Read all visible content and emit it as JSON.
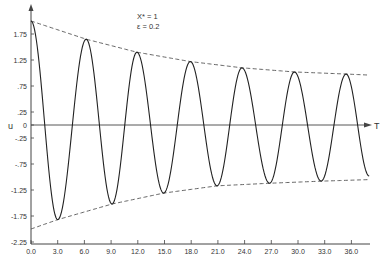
{
  "chart_data": {
    "type": "line",
    "title": "",
    "annotations": [
      "X* = 1",
      "ε = 0.2"
    ],
    "xlabel": "T",
    "ylabel": "u",
    "xlim": [
      0,
      38
    ],
    "ylim": [
      -2.25,
      2.25
    ],
    "grid": false,
    "legend": "none",
    "x_ticks": [
      "0.0",
      "3.0",
      "6.0",
      "9.0",
      "12.0",
      "15.0",
      "18.0",
      "21.0",
      "24.0",
      "27.0",
      "30.0",
      "33.0",
      "36.0"
    ],
    "x_tick_values": [
      0,
      3,
      6,
      9,
      12,
      15,
      18,
      21,
      24,
      27,
      30,
      33,
      36
    ],
    "y_ticks": [
      "1.75",
      "1.25",
      ".75",
      ".25",
      "0",
      "-.25",
      "-.75",
      "-1.25",
      "-1.75",
      "-2.25"
    ],
    "y_tick_values": [
      1.75,
      1.25,
      0.75,
      0.25,
      0,
      -0.25,
      -0.75,
      -1.25,
      -1.75,
      -2.25
    ],
    "series": [
      {
        "name": "u(T) oscillation",
        "style": "solid",
        "extrema": {
          "x": [
            0.0,
            3.0,
            6.2,
            9.1,
            11.9,
            14.9,
            17.9,
            20.9,
            23.7,
            26.8,
            29.6,
            32.6,
            35.4,
            38.0
          ],
          "y": [
            2.0,
            -1.82,
            1.65,
            -1.52,
            1.4,
            -1.31,
            1.22,
            -1.17,
            1.1,
            -1.12,
            1.02,
            -1.08,
            0.98,
            -0.98
          ]
        }
      },
      {
        "name": "upper envelope",
        "style": "dashed",
        "x": [
          0,
          6.2,
          11.9,
          17.9,
          23.7,
          29.6,
          35.4,
          38.0
        ],
        "y": [
          2.0,
          1.65,
          1.4,
          1.22,
          1.1,
          1.02,
          0.98,
          0.96
        ]
      },
      {
        "name": "lower envelope",
        "style": "dashed",
        "x": [
          0,
          3.0,
          9.1,
          14.9,
          20.9,
          26.8,
          32.6,
          38.0
        ],
        "y": [
          -2.0,
          -1.82,
          -1.52,
          -1.31,
          -1.17,
          -1.12,
          -1.08,
          -1.05
        ]
      }
    ]
  },
  "labels": {
    "annot_line1": "X* = 1",
    "annot_line2": "ε = 0.2",
    "xaxis_title": "T",
    "yaxis_title": "u"
  },
  "colors": {
    "line": "#222222",
    "axis": "#444444",
    "envelope": "#555555",
    "text": "#333333",
    "background": "#ffffff"
  }
}
